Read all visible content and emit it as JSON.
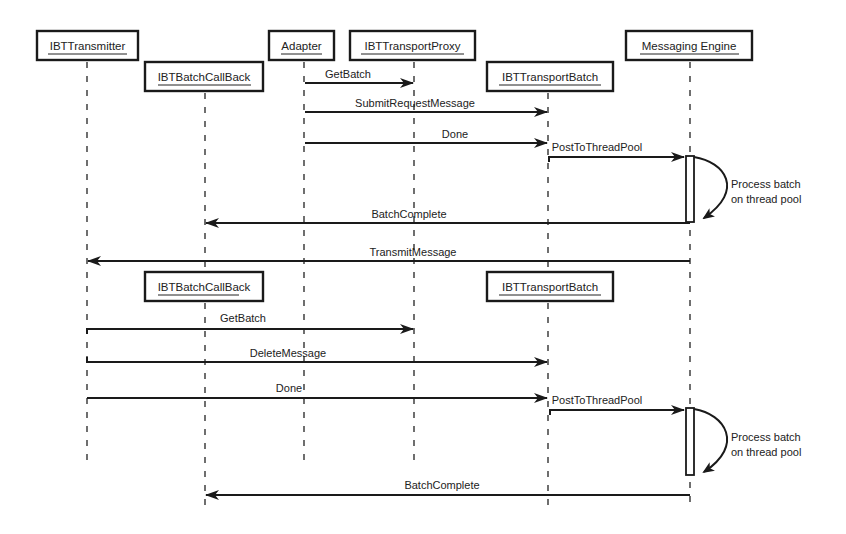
{
  "diagram": {
    "type": "sequence",
    "participants": [
      {
        "id": "transmitter",
        "label": "IBTTransmitter"
      },
      {
        "id": "callback",
        "label": "IBTBatchCallBack"
      },
      {
        "id": "adapter",
        "label": "Adapter"
      },
      {
        "id": "proxy",
        "label": "IBTTransportProxy"
      },
      {
        "id": "batch",
        "label": "IBTTransportBatch"
      },
      {
        "id": "engine",
        "label": "Messaging Engine"
      }
    ],
    "phase1": {
      "messages": [
        {
          "from": "adapter",
          "to": "proxy",
          "label": "GetBatch"
        },
        {
          "from": "adapter",
          "to": "batch",
          "label": "SubmitRequestMessage"
        },
        {
          "from": "adapter",
          "to": "batch",
          "label": "Done"
        },
        {
          "from": "batch",
          "to": "engine",
          "label": "PostToThreadPool"
        },
        {
          "from": "engine",
          "to": "callback",
          "label": "BatchComplete"
        },
        {
          "from": "engine",
          "to": "transmitter",
          "label": "TransmitMessage"
        }
      ],
      "note": [
        "Process batch",
        "on thread pool"
      ]
    },
    "phase2": {
      "created_objects": [
        "IBTBatchCallBack",
        "IBTTransportBatch"
      ],
      "messages": [
        {
          "from": "transmitter",
          "to": "proxy",
          "label": "GetBatch"
        },
        {
          "from": "transmitter",
          "to": "batch",
          "label": "DeleteMessage"
        },
        {
          "from": "transmitter",
          "to": "batch",
          "label": "Done"
        },
        {
          "from": "batch",
          "to": "engine",
          "label": "PostToThreadPool"
        },
        {
          "from": "engine",
          "to": "callback",
          "label": "BatchComplete"
        }
      ],
      "note": [
        "Process batch",
        "on thread pool"
      ]
    }
  }
}
